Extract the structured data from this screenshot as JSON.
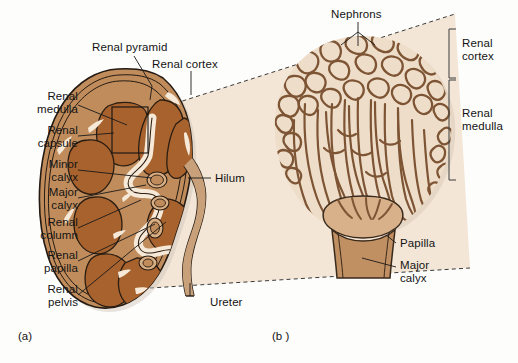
{
  "figure": {
    "title_implied": "Kidney gross anatomy and nephron enlargement",
    "background_color": "#fdfdfc",
    "panels": [
      {
        "id": "a",
        "label": "(a)",
        "x": 18,
        "y": 330,
        "description": "Coronal section of whole kidney"
      },
      {
        "id": "b",
        "label": "(b )",
        "x": 272,
        "y": 330,
        "description": "Enlargement of a renal pyramid showing nephrons"
      }
    ]
  },
  "colors": {
    "page_background": "#fdfdfc",
    "wedge_cream": "#f3e6d7",
    "cortex_tan": "#c08c5c",
    "pyramid_brown": "#a8622e",
    "calyx_tan": "#c08f62",
    "capsule_line": "#2a2018",
    "tubule_line": "#7d5434",
    "tubule_fill": "#e8d5c0",
    "highlight_cream": "#f6e9d8",
    "leader_line": "#1a1a1a",
    "dashed_line": "#3a3a3a",
    "text": "#141414"
  },
  "panel_a": {
    "labels": [
      {
        "name": "renal-pyramid",
        "lines": [
          "Renal pyramid"
        ],
        "x": 92,
        "y": 47,
        "align": "left"
      },
      {
        "name": "renal-cortex",
        "lines": [
          "Renal cortex"
        ],
        "x": 152,
        "y": 64,
        "align": "left"
      },
      {
        "name": "renal-medulla",
        "lines": [
          "Renal",
          "medulla"
        ],
        "x": 74,
        "y": 95,
        "align": "right"
      },
      {
        "name": "renal-capsule",
        "lines": [
          "Renal",
          "capsule"
        ],
        "x": 74,
        "y": 129,
        "align": "right"
      },
      {
        "name": "minor-calyx",
        "lines": [
          "Minor",
          "calyx"
        ],
        "x": 74,
        "y": 163,
        "align": "right"
      },
      {
        "name": "major-calyx",
        "lines": [
          "Major",
          "calyx"
        ],
        "x": 74,
        "y": 192,
        "align": "right"
      },
      {
        "name": "renal-column",
        "lines": [
          "Renal",
          "column"
        ],
        "x": 74,
        "y": 221,
        "align": "right"
      },
      {
        "name": "renal-papilla",
        "lines": [
          "Renal",
          "papilla"
        ],
        "x": 74,
        "y": 255,
        "align": "right"
      },
      {
        "name": "renal-pelvis",
        "lines": [
          "Renal",
          "pelvis"
        ],
        "x": 74,
        "y": 289,
        "align": "right"
      },
      {
        "name": "hilum",
        "lines": [
          "Hilum"
        ],
        "x": 215,
        "y": 173,
        "align": "left"
      },
      {
        "name": "ureter",
        "lines": [
          "Ureter"
        ],
        "x": 212,
        "y": 297,
        "align": "left"
      }
    ]
  },
  "panel_b": {
    "labels": [
      {
        "name": "nephrons",
        "lines": [
          "Nephrons"
        ],
        "x": 334,
        "y": 8,
        "align": "left"
      },
      {
        "name": "papilla",
        "lines": [
          "Papilla"
        ],
        "x": 400,
        "y": 238,
        "align": "left"
      },
      {
        "name": "major-calyx-b",
        "lines": [
          "Major",
          "calyx"
        ],
        "x": 400,
        "y": 262,
        "align": "left"
      }
    ],
    "brackets": [
      {
        "name": "renal-cortex-bracket",
        "lines": [
          "Renal",
          "cortex"
        ],
        "top": 29,
        "bottom": 78,
        "text_x": 470,
        "text_y": 43
      },
      {
        "name": "renal-medulla-bracket",
        "lines": [
          "Renal",
          "medulla"
        ],
        "top": 78,
        "bottom": 180,
        "text_x": 470,
        "text_y": 113
      }
    ]
  }
}
